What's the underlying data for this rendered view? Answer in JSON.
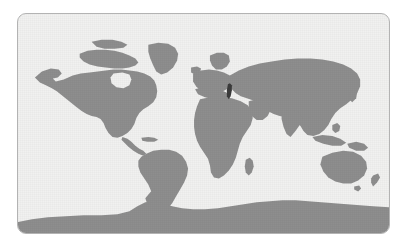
{
  "map": {
    "title": "World map locator",
    "projection": "equirectangular",
    "card": {
      "background_color": "#f1f1f0",
      "border_color": "#b3b3b3",
      "corner_radius_px": 9
    },
    "land_color": "#8e8e8e",
    "ocean_color": "#f1f1f0",
    "highlight_color": "#3b3b3b",
    "highlighted_region": {
      "name": "Israel",
      "region": "Eastern Mediterranean / Levant",
      "continent": "Asia",
      "marker_shape": "narrow vertical sliver",
      "approx_position_px": {
        "x": 230,
        "y": 88
      }
    },
    "landmasses": [
      {
        "name": "North America"
      },
      {
        "name": "Greenland"
      },
      {
        "name": "South America"
      },
      {
        "name": "Europe"
      },
      {
        "name": "Africa"
      },
      {
        "name": "Madagascar"
      },
      {
        "name": "Asia"
      },
      {
        "name": "Indonesia"
      },
      {
        "name": "Australia"
      },
      {
        "name": "New Zealand"
      },
      {
        "name": "Antarctica"
      }
    ],
    "labels": [],
    "legend": []
  }
}
